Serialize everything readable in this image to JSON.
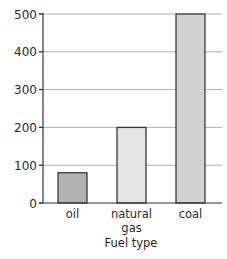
{
  "chart_data": {
    "type": "bar",
    "title": "",
    "xlabel": "Fuel type",
    "ylabel": "",
    "categories": [
      {
        "label_lines": [
          "oil"
        ]
      },
      {
        "label_lines": [
          "natural",
          "gas"
        ]
      },
      {
        "label_lines": [
          "coal"
        ]
      }
    ],
    "category_names": [
      "oil",
      "natural gas",
      "coal"
    ],
    "values": [
      80,
      200,
      500
    ],
    "bar_colors": [
      "#b3b3b3",
      "#e4e4e4",
      "#d2d2d2"
    ],
    "ylim": [
      0,
      500
    ],
    "yticks": [
      0,
      100,
      200,
      300,
      400,
      500
    ],
    "ytick_labels": [
      "0",
      "100",
      "200",
      "300",
      "400",
      "500"
    ],
    "grid": true,
    "legend": null
  }
}
